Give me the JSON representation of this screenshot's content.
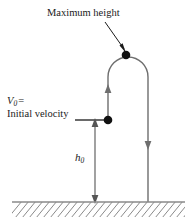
{
  "figure": {
    "background_color": "#ffffff",
    "stroke_color": "#6e6e6e",
    "text_color": "#1a1a1a",
    "marker_color": "#111111"
  },
  "labels": {
    "max_height": "Maximum height",
    "v0_symbol": "V",
    "v0_subscript": "0",
    "v0_equals": "=",
    "v0_description": "Initial velocity",
    "h0_symbol": "h",
    "h0_subscript": "0"
  },
  "annotations": {
    "apex_marker": "maximum-height-point",
    "launch_marker": "initial-position-point",
    "upward_arrow": "ascent-direction",
    "downward_arrow": "descent-direction",
    "height_dimension": "h0-dimension-line",
    "ground": "ground-line-with-hatching"
  },
  "geometry": {
    "apex_point": [
      126,
      55
    ],
    "launch_point": [
      108,
      120
    ],
    "arc_left_x": 108,
    "arc_right_x": 148,
    "arc_top_y": 57,
    "ground_y": 202,
    "dimension_x": 95,
    "ground_x_start": 12,
    "ground_x_end": 185
  }
}
